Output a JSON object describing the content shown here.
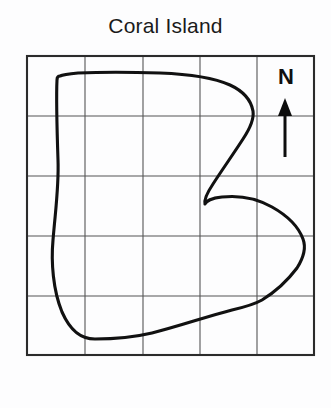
{
  "figure": {
    "title": "Coral Island",
    "type": "map",
    "background_color": "#fdfdfe"
  },
  "compass": {
    "label": "N",
    "direction": "north",
    "arrow_color": "#0d0d0d"
  },
  "grid": {
    "columns": 5,
    "rows": 5,
    "line_color": "#555555",
    "border_color": "#2b2b2b",
    "x_positions": [
      27,
      85,
      143,
      200,
      257,
      314
    ],
    "y_positions": [
      56,
      116,
      176,
      236,
      296,
      355
    ]
  },
  "coastline": {
    "color": "#111111",
    "stroke_width": 3.1,
    "path": "M 60 76 C 58 76 57 77 57 80 C 56 100 57 130 58 160 C 59 185 56 205 53 240 C 51 262 53 290 62 312 C 70 330 80 339 95 339 C 115 339 135 337 152 333 C 180 326 205 317 232 310 C 245 307 255 304 262 300 C 275 292 288 280 297 268 C 304 257 306 247 303 239 C 299 228 288 216 272 207 C 258 199 240 195 222 197 C 212 198 206 201 205 204 C 204 200 207 193 213 184 C 222 170 234 153 243 139 C 251 127 254 118 253 111 C 251 100 243 91 230 85 C 212 77 186 74 160 73 C 130 72 100 72 78 73 C 68 74 62 75 60 76 Z"
  }
}
